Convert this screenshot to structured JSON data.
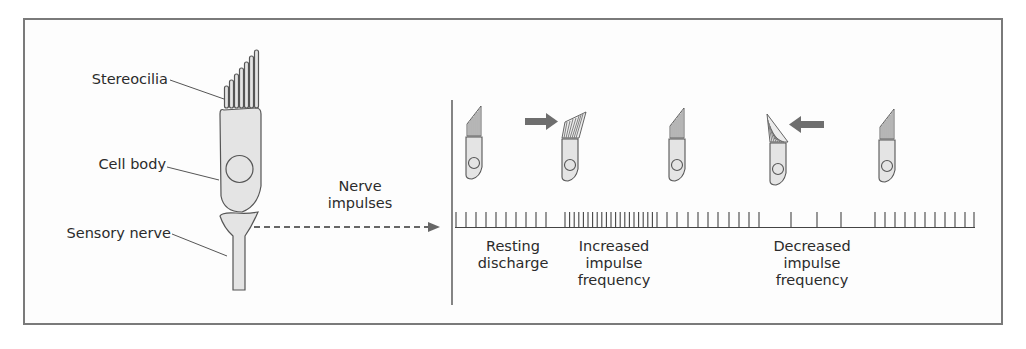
{
  "figure": {
    "labels": {
      "stereocilia": "Stereocilia",
      "cell_body": "Cell body",
      "sensory_nerve": "Sensory nerve",
      "nerve_impulses_line1": "Nerve",
      "nerve_impulses_line2": "impulses"
    },
    "phases": [
      {
        "id": "resting",
        "line1": "Resting",
        "line2": "discharge",
        "line3": ""
      },
      {
        "id": "increased",
        "line1": "Increased",
        "line2": "impulse",
        "line3": "frequency"
      },
      {
        "id": "decreased",
        "line1": "Decreased",
        "line2": "impulse",
        "line3": "frequency"
      }
    ],
    "cell_states": [
      {
        "position": 1,
        "bundle": "upright",
        "push_arrow": "none"
      },
      {
        "position": 2,
        "bundle": "bent-right",
        "push_arrow": "right"
      },
      {
        "position": 3,
        "bundle": "upright",
        "push_arrow": "none"
      },
      {
        "position": 4,
        "bundle": "bent-left",
        "push_arrow": "left"
      },
      {
        "position": 5,
        "bundle": "upright",
        "push_arrow": "none"
      }
    ],
    "colors": {
      "frame": "#7a7a7a",
      "cell_fill": "#e4e4e4",
      "outline": "#555555",
      "arrow": "#6e6e6e",
      "text": "#2b2b2b"
    }
  }
}
